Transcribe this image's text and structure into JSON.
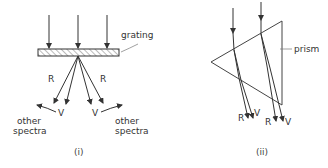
{
  "figure": {
    "panel_i": {
      "caption": "(i)",
      "grating_label": "grating",
      "ray_labels": {
        "red_left": "R",
        "red_right": "R",
        "violet_left": "V",
        "violet_right": "V"
      },
      "side_labels": {
        "left_line1": "other",
        "left_line2": "spectra",
        "right_line1": "other",
        "right_line2": "spectra"
      }
    },
    "panel_ii": {
      "caption": "(ii)",
      "prism_label": "prism",
      "ray_labels": {
        "red_1": "R",
        "violet_1": "V",
        "red_2": "R",
        "violet_2": "V"
      }
    }
  }
}
